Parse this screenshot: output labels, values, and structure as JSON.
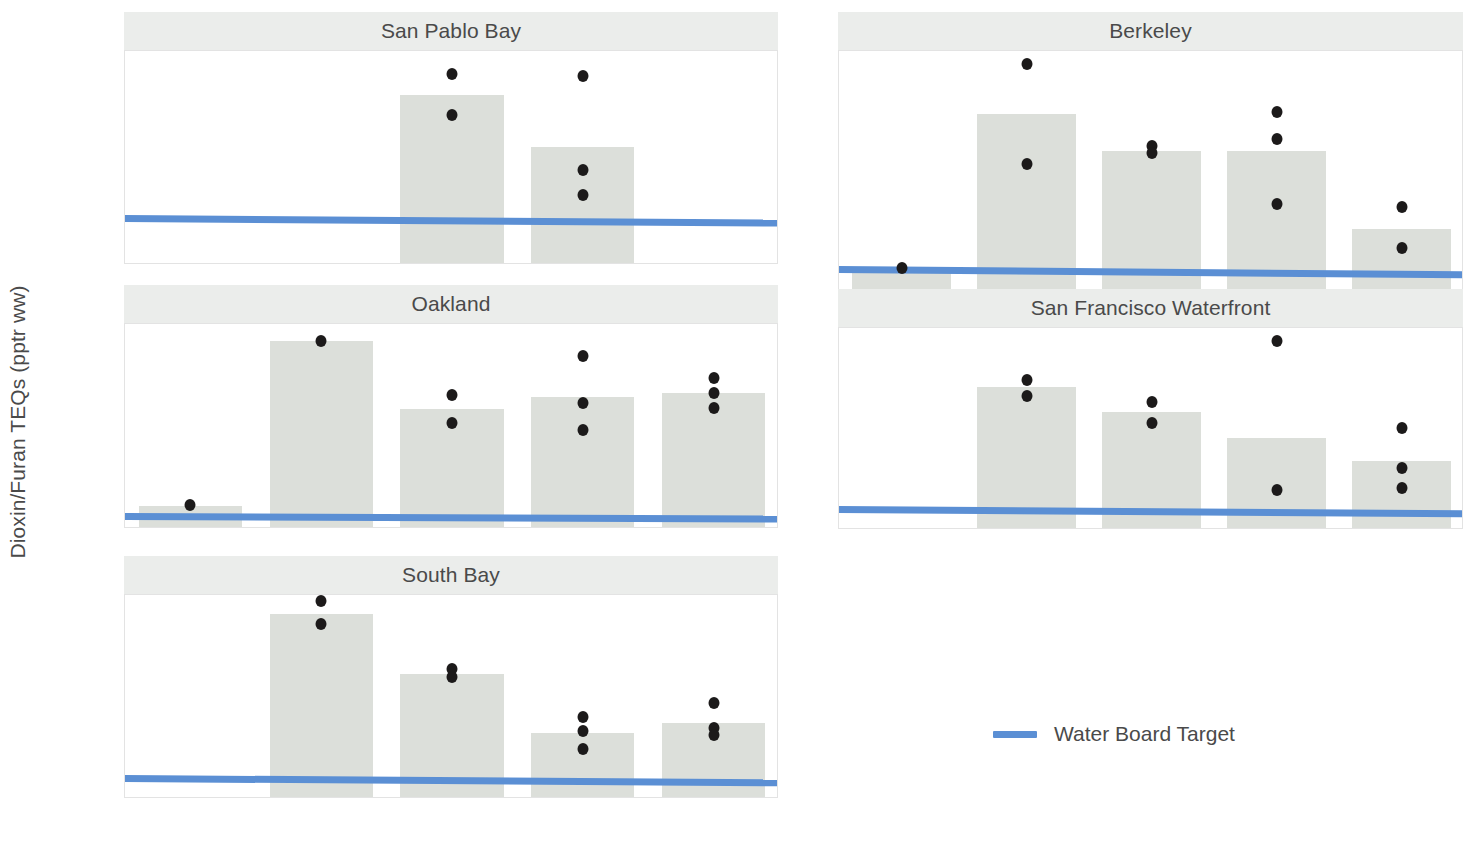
{
  "chart_data": {
    "type": "bar",
    "title": "",
    "xlabel": "",
    "ylabel": "Dioxin/Furan TEQs (pptr ww)",
    "categories": [
      "1994",
      "2000",
      "2009",
      "2014",
      "2019"
    ],
    "grid": false,
    "legend_position": "bottom-right",
    "legend": [
      {
        "name": "Water Board Target",
        "color": "#5b8fd4",
        "marker": "line"
      }
    ],
    "bar_color": "#dcdfda",
    "point_color": "#1c1a1a",
    "target_color": "#5b8fd4",
    "strip_color": "#ebedeb",
    "facets": [
      {
        "id": "san-pablo-bay",
        "title": "San Pablo Bay",
        "ylim": [
          0.0,
          0.655
        ],
        "yticks": [
          "0.0",
          "0.2",
          "0.4",
          "0.6"
        ],
        "ytickvals": [
          0.0,
          0.2,
          0.4,
          0.6
        ],
        "target_left": 0.142,
        "target_right": 0.128,
        "bars": [
          null,
          null,
          0.52,
          0.36,
          null
        ],
        "points": [
          [],
          [],
          [
            0.585,
            0.46
          ],
          [
            0.58,
            0.29,
            0.215
          ],
          []
        ]
      },
      {
        "id": "berkeley",
        "title": "Berkeley",
        "ylim": [
          0.0,
          1.36
        ],
        "yticks": [
          "0.0",
          "0.5",
          "1.0"
        ],
        "ytickvals": [
          0.0,
          0.5,
          1.0
        ],
        "target_left": 0.142,
        "target_right": 0.112,
        "bars": [
          0.13,
          1.01,
          0.8,
          0.8,
          0.37
        ],
        "points": [
          [
            0.15
          ],
          [
            1.29,
            0.73
          ],
          [
            0.83,
            0.79
          ],
          [
            1.02,
            0.87,
            0.51
          ],
          [
            0.49,
            0.26
          ]
        ]
      },
      {
        "id": "oakland",
        "title": "Oakland",
        "ylim": [
          0.0,
          2.42
        ],
        "yticks": [
          "0.0",
          "0.5",
          "1.0",
          "1.5",
          "2.0"
        ],
        "ytickvals": [
          0.0,
          0.5,
          1.0,
          1.5,
          2.0
        ],
        "target_left": 0.142,
        "target_right": 0.112,
        "bars": [
          0.27,
          2.22,
          1.42,
          1.56,
          1.6
        ],
        "points": [
          [
            0.28
          ],
          [
            2.22
          ],
          [
            1.58,
            1.25
          ],
          [
            2.04,
            1.49,
            1.17
          ],
          [
            1.78,
            1.6,
            1.43
          ]
        ]
      },
      {
        "id": "san-francisco-waterfront",
        "title": "San Francisco Waterfront",
        "ylim": [
          0.0,
          1.4
        ],
        "yticks": [
          "0.0",
          "0.5",
          "1.0"
        ],
        "ytickvals": [
          0.0,
          0.5,
          1.0
        ],
        "target_left": 0.142,
        "target_right": 0.112,
        "bars": [
          null,
          0.99,
          0.82,
          0.64,
          0.48
        ],
        "points": [
          [],
          [
            1.04,
            0.93
          ],
          [
            0.89,
            0.74
          ],
          [
            1.31,
            0.28
          ],
          [
            0.71,
            0.43,
            0.29
          ]
        ]
      },
      {
        "id": "south-bay",
        "title": "South Bay",
        "ylim": [
          0.0,
          1.4
        ],
        "yticks": [
          "0.0",
          "0.5",
          "1.0"
        ],
        "ytickvals": [
          0.0,
          0.5,
          1.0
        ],
        "target_left": 0.142,
        "target_right": 0.112,
        "bars": [
          null,
          1.27,
          0.86,
          0.45,
          0.52
        ],
        "points": [
          [],
          [
            1.36,
            1.2
          ],
          [
            0.89,
            0.84
          ],
          [
            0.56,
            0.47,
            0.34
          ],
          [
            0.66,
            0.49,
            0.44
          ]
        ]
      }
    ]
  }
}
